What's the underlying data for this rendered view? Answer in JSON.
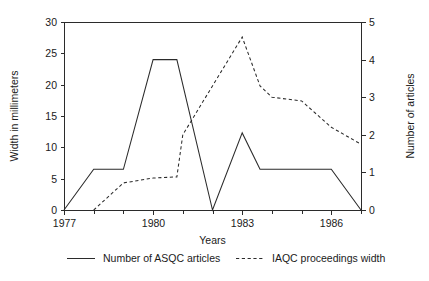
{
  "chart_data": {
    "type": "line",
    "title": "",
    "xlabel": "Years",
    "ylabel": "Width in millimeters",
    "y2label": "Number of articles",
    "xlim": [
      1977,
      1987
    ],
    "ylim": [
      0,
      30
    ],
    "y2lim": [
      0,
      5
    ],
    "grid": false,
    "legend_position": "bottom",
    "x_ticks_major": [
      1977,
      1980,
      1983,
      1986
    ],
    "x_tick_labels": [
      "1977",
      "1980",
      "1983",
      "1986"
    ],
    "x_ticks_minor": [
      1978,
      1979,
      1981,
      1982,
      1984,
      1985,
      1987
    ],
    "y_ticks": [
      0,
      5,
      10,
      15,
      20,
      25,
      30
    ],
    "y_tick_labels": [
      "0",
      "5",
      "10",
      "15",
      "20",
      "25",
      "30"
    ],
    "y2_ticks": [
      0,
      1,
      2,
      3,
      4,
      5
    ],
    "y2_tick_labels": [
      "0",
      "1",
      "2",
      "3",
      "4",
      "5"
    ],
    "series": [
      {
        "name": "Number of ASQC articles",
        "style": "solid",
        "axis": "left",
        "color": "#2b2b2b",
        "x": [
          1977,
          1978,
          1979,
          1980,
          1980.8,
          1982,
          1983,
          1983.6,
          1986,
          1987
        ],
        "values": [
          0,
          6.5,
          6.5,
          24,
          24,
          0,
          12.3,
          6.5,
          6.5,
          0
        ]
      },
      {
        "name": "IAQC proceedings width",
        "style": "dashed",
        "axis": "right",
        "color": "#2b2b2b",
        "x": [
          1978,
          1979,
          1980,
          1980.8,
          1981,
          1982,
          1983,
          1983.6,
          1984,
          1985,
          1986,
          1987
        ],
        "values": [
          0,
          0.72,
          0.85,
          0.88,
          2.0,
          3.3,
          4.6,
          3.3,
          3.0,
          2.9,
          2.2,
          1.75
        ]
      }
    ]
  },
  "legend": {
    "items": [
      {
        "label": "Number of ASQC articles",
        "style": "solid"
      },
      {
        "label": "IAQC proceedings width",
        "style": "dashed"
      }
    ]
  }
}
